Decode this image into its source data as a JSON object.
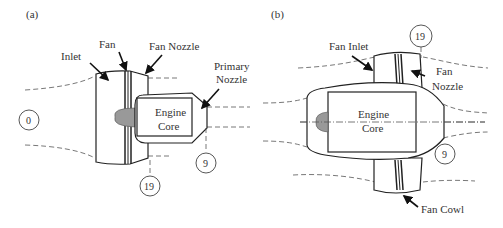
{
  "panels": {
    "a": {
      "tag": "(a)",
      "labels": {
        "inlet": "Inlet",
        "fan": "Fan",
        "fan_nozzle": "Fan Nozzle",
        "primary_nozzle_1": "Primary",
        "primary_nozzle_2": "Nozzle",
        "engine_core_1": "Engine",
        "engine_core_2": "Core"
      },
      "stations": {
        "s0": "0",
        "s19": "19",
        "s9": "9"
      }
    },
    "b": {
      "tag": "(b)",
      "labels": {
        "fan_inlet": "Fan Inlet",
        "fan_nozzle_1": "Fan",
        "fan_nozzle_2": "Nozzle",
        "engine_core_1": "Engine",
        "engine_core_2": "Core",
        "fan_cowl": "Fan Cowl"
      },
      "stations": {
        "s19": "19",
        "s9": "9"
      }
    }
  },
  "colors": {
    "line": "#222222",
    "spinner": "#999999",
    "background": "#ffffff"
  }
}
